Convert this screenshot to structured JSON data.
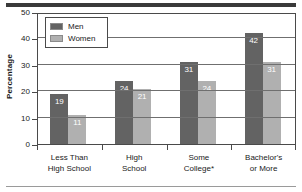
{
  "chart_data": {
    "type": "bar",
    "title": "",
    "xlabel": "",
    "ylabel": "Percentage",
    "ylim": [
      0,
      50
    ],
    "yticks": [
      0,
      10,
      20,
      30,
      40,
      50
    ],
    "grid": true,
    "legend_position": "top-left",
    "categories": [
      "Less Than\nHigh School",
      "High\nSchool",
      "Some\nCollege*",
      "Bachelor's\nor More"
    ],
    "category_lines": [
      [
        "Less Than",
        "High School"
      ],
      [
        "High",
        "School"
      ],
      [
        "Some",
        "College*"
      ],
      [
        "Bachelor's",
        "or More"
      ]
    ],
    "series": [
      {
        "name": "Men",
        "color": "#636363",
        "values": [
          19,
          24,
          31,
          42
        ]
      },
      {
        "name": "Women",
        "color": "#b0b0b0",
        "values": [
          11,
          21,
          24,
          31
        ]
      }
    ]
  },
  "legend": {
    "items": [
      {
        "label": "Men"
      },
      {
        "label": "Women"
      }
    ]
  },
  "axis": {
    "y_title": "Percentage",
    "y_tick_labels": [
      "50",
      "40",
      "30",
      "20",
      "10",
      "0"
    ]
  },
  "colors": {
    "men": "#636363",
    "women": "#b0b0b0",
    "rule_top": "#3a3a3a",
    "rule_bottom": "#9a9a9a",
    "frame": "#4a4a4a",
    "gridline": "#6f6f6f",
    "label_text": "#1a1a1a",
    "value_text": "#ffffff"
  }
}
